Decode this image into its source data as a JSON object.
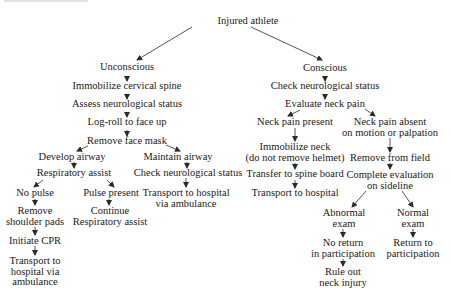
{
  "diagram": {
    "type": "flowchart",
    "title_fragment_illegible": true,
    "colors": {
      "text": "#1a1a1a",
      "lines": "#2a2a2a",
      "background": "#ffffff"
    },
    "nodes": {
      "root": {
        "lines": [
          "Injured athlete"
        ]
      },
      "unconscious": {
        "lines": [
          "Unconscious"
        ]
      },
      "immobilize_cspine": {
        "lines": [
          "Immobilize cervical spine"
        ]
      },
      "assess_neuro": {
        "lines": [
          "Assess neurological status"
        ]
      },
      "log_roll": {
        "lines": [
          "Log-roll to face up"
        ]
      },
      "remove_face_mask": {
        "lines": [
          "Remove face mask"
        ]
      },
      "develop_airway": {
        "lines": [
          "Develop airway"
        ]
      },
      "respiratory_assist": {
        "lines": [
          "Respiratory assist"
        ]
      },
      "no_pulse": {
        "lines": [
          "No pulse"
        ]
      },
      "remove_shoulder_pads": {
        "lines": [
          "Remove",
          "shoulder pads"
        ]
      },
      "initiate_cpr": {
        "lines": [
          "Initiate CPR"
        ]
      },
      "transport_ambulance_a": {
        "lines": [
          "Transport to",
          "hospital via",
          "ambulance"
        ]
      },
      "pulse_present": {
        "lines": [
          "Pulse present"
        ]
      },
      "continue_resp": {
        "lines": [
          "Continue",
          "Respiratory assist"
        ]
      },
      "maintain_airway": {
        "lines": [
          "Maintain airway"
        ]
      },
      "check_neuro_u": {
        "lines": [
          "Check neurological status"
        ]
      },
      "transport_ambulance_b": {
        "lines": [
          "Transport to hospital",
          "via ambulance"
        ]
      },
      "conscious": {
        "lines": [
          "Conscious"
        ]
      },
      "check_neuro_c": {
        "lines": [
          "Check neurological status"
        ]
      },
      "evaluate_neck": {
        "lines": [
          "Evaluate neck pain"
        ]
      },
      "neck_pain_present": {
        "lines": [
          "Neck pain present"
        ]
      },
      "immobilize_neck": {
        "lines": [
          "Immobilize neck",
          "(do not remove helmet)"
        ]
      },
      "transfer_spine_board": {
        "lines": [
          "Transfer to spine board"
        ]
      },
      "transport_hospital": {
        "lines": [
          "Transport to hospital"
        ]
      },
      "neck_pain_absent": {
        "lines": [
          "Neck pain absent",
          "on motion or palpation"
        ]
      },
      "remove_from_field": {
        "lines": [
          "Remove from field"
        ]
      },
      "complete_eval": {
        "lines": [
          "Complete evaluation",
          "on sideline"
        ]
      },
      "abnormal_exam": {
        "lines": [
          "Abnormal",
          "exam"
        ]
      },
      "no_return": {
        "lines": [
          "No return",
          "in participation"
        ]
      },
      "rule_out": {
        "lines": [
          "Rule out",
          "neck injury"
        ]
      },
      "normal_exam": {
        "lines": [
          "Normal",
          "exam"
        ]
      },
      "return_participation": {
        "lines": [
          "Return to",
          "participation"
        ]
      }
    },
    "edges": [
      [
        "root",
        "unconscious"
      ],
      [
        "root",
        "conscious"
      ],
      [
        "unconscious",
        "immobilize_cspine"
      ],
      [
        "immobilize_cspine",
        "assess_neuro"
      ],
      [
        "assess_neuro",
        "log_roll"
      ],
      [
        "log_roll",
        "remove_face_mask"
      ],
      [
        "remove_face_mask",
        "develop_airway"
      ],
      [
        "remove_face_mask",
        "maintain_airway"
      ],
      [
        "develop_airway",
        "respiratory_assist"
      ],
      [
        "respiratory_assist",
        "no_pulse"
      ],
      [
        "respiratory_assist",
        "pulse_present"
      ],
      [
        "no_pulse",
        "remove_shoulder_pads"
      ],
      [
        "remove_shoulder_pads",
        "initiate_cpr"
      ],
      [
        "initiate_cpr",
        "transport_ambulance_a"
      ],
      [
        "pulse_present",
        "continue_resp"
      ],
      [
        "maintain_airway",
        "check_neuro_u"
      ],
      [
        "check_neuro_u",
        "transport_ambulance_b"
      ],
      [
        "conscious",
        "check_neuro_c"
      ],
      [
        "check_neuro_c",
        "evaluate_neck"
      ],
      [
        "evaluate_neck",
        "neck_pain_present"
      ],
      [
        "evaluate_neck",
        "neck_pain_absent"
      ],
      [
        "neck_pain_present",
        "immobilize_neck"
      ],
      [
        "immobilize_neck",
        "transfer_spine_board"
      ],
      [
        "transfer_spine_board",
        "transport_hospital"
      ],
      [
        "neck_pain_absent",
        "remove_from_field"
      ],
      [
        "remove_from_field",
        "complete_eval"
      ],
      [
        "complete_eval",
        "abnormal_exam"
      ],
      [
        "complete_eval",
        "normal_exam"
      ],
      [
        "abnormal_exam",
        "no_return"
      ],
      [
        "no_return",
        "rule_out"
      ],
      [
        "normal_exam",
        "return_participation"
      ]
    ]
  }
}
